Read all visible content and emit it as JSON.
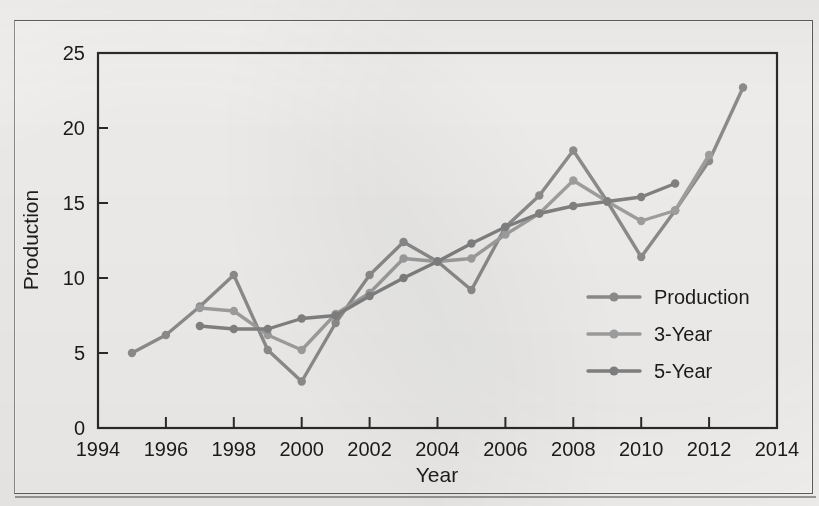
{
  "chart_data": {
    "type": "line",
    "title": "",
    "xlabel": "Year",
    "ylabel": "Production",
    "xlim": [
      1994,
      2014
    ],
    "ylim": [
      0,
      25
    ],
    "xticks": [
      1994,
      1996,
      1998,
      2000,
      2002,
      2004,
      2006,
      2008,
      2010,
      2012,
      2014
    ],
    "yticks": [
      0,
      5,
      10,
      15,
      20,
      25
    ],
    "xtick_labels": [
      "1994",
      "1996",
      "1998",
      "2000",
      "2002",
      "2004",
      "2006",
      "2008",
      "2010",
      "2012",
      "2014"
    ],
    "ytick_labels": [
      "0",
      "5",
      "10",
      "15",
      "20",
      "25"
    ],
    "grid": false,
    "legend_position": "center-right",
    "series": [
      {
        "name": "Production",
        "color": "#8f8f8f",
        "x": [
          1995,
          1996,
          1997,
          1998,
          1999,
          2000,
          2001,
          2002,
          2003,
          2004,
          2005,
          2006,
          2007,
          2008,
          2009,
          2010,
          2011,
          2012,
          2013
        ],
        "values": [
          5.0,
          6.2,
          8.1,
          10.2,
          5.2,
          3.1,
          7.0,
          10.2,
          12.4,
          11.1,
          9.2,
          13.4,
          15.5,
          18.5,
          15.1,
          11.4,
          14.5,
          17.8,
          22.7
        ]
      },
      {
        "name": "3-Year",
        "color": "#a2a2a2",
        "x": [
          1997,
          1998,
          1999,
          2000,
          2001,
          2002,
          2003,
          2004,
          2005,
          2006,
          2007,
          2008,
          2009,
          2010,
          2011,
          2012
        ],
        "values": [
          8.0,
          7.8,
          6.2,
          5.2,
          7.6,
          9.0,
          11.3,
          11.1,
          11.3,
          12.9,
          14.3,
          16.5,
          15.1,
          13.8,
          14.5,
          18.2
        ]
      },
      {
        "name": "5-Year",
        "color": "#848484",
        "x": [
          1997,
          1998,
          1999,
          2000,
          2001,
          2002,
          2003,
          2004,
          2005,
          2006,
          2007,
          2008,
          2009,
          2010,
          2011
        ],
        "values": [
          6.8,
          6.6,
          6.6,
          7.3,
          7.5,
          8.8,
          10.0,
          11.1,
          12.3,
          13.4,
          14.3,
          14.8,
          15.1,
          15.4,
          16.3
        ]
      }
    ]
  },
  "legend": {
    "entries": [
      {
        "label": "Production",
        "color": "#8f8f8f"
      },
      {
        "label": "3-Year",
        "color": "#a2a2a2"
      },
      {
        "label": "5-Year",
        "color": "#848484"
      }
    ]
  },
  "axis_titles": {
    "x": "Year",
    "y": "Production"
  }
}
